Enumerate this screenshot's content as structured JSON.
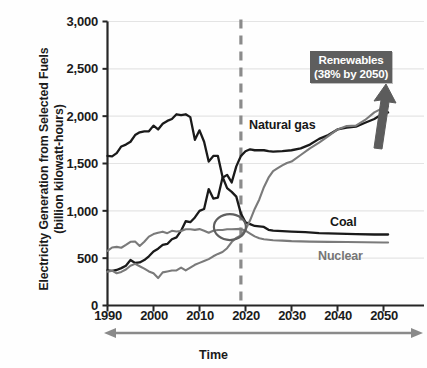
{
  "chart_data": {
    "type": "line",
    "title": "",
    "ylabel": "Electricity Generation from Selected Fuels (billion kilowatt-hours)",
    "ylabel_line1": "Electricity Generation from Selected Fuels",
    "ylabel_line2": "(billion kilowatt-hours)",
    "xlabel": "Time",
    "xlim": [
      1990,
      2053
    ],
    "ylim": [
      0,
      3000
    ],
    "ytick_labels": [
      "0",
      "500",
      "1,000",
      "1,500",
      "2,000",
      "2,500",
      "3,000"
    ],
    "ytick_values": [
      0,
      500,
      1000,
      1500,
      2000,
      2500,
      3000
    ],
    "xtick_labels": [
      "1990",
      "2000",
      "2010",
      "2020",
      "2030",
      "2040",
      "2050"
    ],
    "xtick_values": [
      1990,
      2000,
      2010,
      2020,
      2030,
      2040,
      2050
    ],
    "grid": "horizontal",
    "legend_position": "inline-series-labels",
    "projection_divider_year": 2019,
    "annotations": [
      {
        "name": "renewables-callout",
        "line1": "Renewables",
        "line2": "(38% by 2050)",
        "text": "Renewables (38% by 2050)",
        "color": "#ffffff",
        "background": "#5e5e5e"
      },
      {
        "name": "crossover-circle",
        "description": "circle highlighting natural gas / coal / nuclear crossover",
        "year": 2019,
        "value": 850
      },
      {
        "name": "growth-arrow",
        "description": "thick upward arrow indicating renewables growth"
      }
    ],
    "series": [
      {
        "name": "Natural gas",
        "color": "#1a1a1a",
        "label_color": "#171717",
        "x": [
          1990,
          1991,
          1992,
          1993,
          1994,
          1995,
          1996,
          1997,
          1998,
          1999,
          2000,
          2001,
          2002,
          2003,
          2004,
          2005,
          2006,
          2007,
          2008,
          2009,
          2010,
          2011,
          2012,
          2013,
          2014,
          2015,
          2016,
          2017,
          2018,
          2019,
          2020,
          2021,
          2022,
          2023,
          2024,
          2025,
          2026,
          2028,
          2030,
          2032,
          2034,
          2036,
          2038,
          2040,
          2042,
          2044,
          2046,
          2048,
          2050,
          2051
        ],
        "values": [
          372,
          365,
          375,
          395,
          420,
          480,
          450,
          455,
          480,
          520,
          570,
          600,
          640,
          650,
          700,
          720,
          790,
          890,
          880,
          930,
          1000,
          1020,
          1230,
          1130,
          1140,
          1350,
          1380,
          1300,
          1470,
          1580,
          1630,
          1650,
          1640,
          1640,
          1640,
          1630,
          1625,
          1630,
          1640,
          1660,
          1700,
          1760,
          1800,
          1860,
          1880,
          1890,
          1930,
          1970,
          2030,
          2040
        ]
      },
      {
        "name": "Coal",
        "color": "#1a1a1a",
        "label_color": "#171717",
        "x": [
          1990,
          1991,
          1992,
          1993,
          1994,
          1995,
          1996,
          1997,
          1998,
          1999,
          2000,
          2001,
          2002,
          2003,
          2004,
          2005,
          2006,
          2007,
          2008,
          2009,
          2010,
          2011,
          2012,
          2013,
          2014,
          2015,
          2016,
          2017,
          2018,
          2019,
          2020,
          2021,
          2022,
          2023,
          2024,
          2025,
          2026,
          2028,
          2030,
          2033,
          2036,
          2040,
          2044,
          2048,
          2051
        ],
        "values": [
          1580,
          1575,
          1610,
          1680,
          1700,
          1730,
          1800,
          1830,
          1840,
          1840,
          1900,
          1860,
          1920,
          1950,
          1970,
          2020,
          2010,
          2020,
          1990,
          1750,
          1850,
          1730,
          1520,
          1580,
          1580,
          1360,
          1240,
          1200,
          1150,
          970,
          880,
          860,
          840,
          835,
          830,
          800,
          790,
          785,
          780,
          775,
          765,
          760,
          755,
          750,
          750
        ]
      },
      {
        "name": "Nuclear",
        "color": "#7a7a7a",
        "label_color": "#767676",
        "x": [
          1990,
          1991,
          1992,
          1993,
          1994,
          1995,
          1996,
          1997,
          1998,
          1999,
          2000,
          2001,
          2002,
          2003,
          2004,
          2005,
          2006,
          2007,
          2008,
          2009,
          2010,
          2011,
          2012,
          2013,
          2014,
          2015,
          2016,
          2017,
          2018,
          2019,
          2020,
          2021,
          2022,
          2023,
          2024,
          2025,
          2026,
          2028,
          2030,
          2034,
          2038,
          2042,
          2046,
          2050,
          2051
        ],
        "values": [
          577,
          613,
          619,
          610,
          640,
          673,
          675,
          629,
          674,
          728,
          754,
          769,
          780,
          764,
          789,
          782,
          787,
          806,
          806,
          799,
          807,
          790,
          769,
          789,
          797,
          797,
          805,
          805,
          807,
          809,
          790,
          760,
          730,
          710,
          700,
          695,
          690,
          685,
          680,
          675,
          672,
          670,
          668,
          665,
          665
        ]
      },
      {
        "name": "Renewables",
        "color": "#7a7a7a",
        "label_color": "#ffffff",
        "x": [
          1990,
          1991,
          1992,
          1993,
          1994,
          1995,
          1996,
          1997,
          1998,
          1999,
          2000,
          2001,
          2002,
          2003,
          2004,
          2005,
          2006,
          2007,
          2008,
          2009,
          2010,
          2011,
          2012,
          2013,
          2014,
          2015,
          2016,
          2017,
          2018,
          2019,
          2020,
          2021,
          2022,
          2023,
          2024,
          2025,
          2026,
          2027,
          2028,
          2029,
          2030,
          2032,
          2034,
          2036,
          2038,
          2040,
          2042,
          2044,
          2046,
          2048,
          2050,
          2051
        ],
        "values": [
          358,
          368,
          340,
          355,
          380,
          420,
          440,
          415,
          390,
          360,
          340,
          290,
          350,
          360,
          370,
          370,
          400,
          370,
          400,
          430,
          450,
          470,
          490,
          520,
          545,
          565,
          605,
          670,
          715,
          740,
          800,
          900,
          1020,
          1120,
          1250,
          1350,
          1420,
          1450,
          1480,
          1505,
          1520,
          1590,
          1660,
          1720,
          1790,
          1860,
          1895,
          1900,
          1960,
          2040,
          2090,
          2105
        ]
      }
    ]
  }
}
